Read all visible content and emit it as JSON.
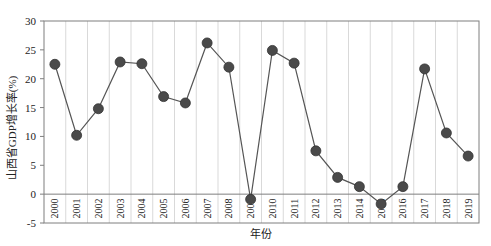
{
  "chart_data": {
    "type": "line",
    "title": "",
    "xlabel": "年份",
    "ylabel": "山西省GDP增长率(%)",
    "ylim": [
      -5,
      30
    ],
    "yticks": [
      -5,
      0,
      5,
      10,
      15,
      20,
      25,
      30
    ],
    "grid": {
      "vertical": true,
      "horizontal": false
    },
    "legend": null,
    "categories": [
      "2000",
      "2001",
      "2002",
      "2003",
      "2004",
      "2005",
      "2006",
      "2007",
      "2008",
      "2009",
      "2010",
      "2011",
      "2012",
      "2013",
      "2014",
      "2015",
      "2016",
      "2017",
      "2018",
      "2019"
    ],
    "series": [
      {
        "name": "山西省GDP增长率",
        "color": "#555555",
        "marker": "circle",
        "values": [
          22.5,
          10.2,
          14.8,
          22.9,
          22.6,
          16.9,
          15.8,
          26.2,
          22.0,
          -0.9,
          24.9,
          22.7,
          7.5,
          2.9,
          1.3,
          -1.7,
          1.3,
          21.7,
          10.6,
          6.6
        ]
      }
    ]
  },
  "colors": {
    "line": "#555555",
    "marker": "#4a4a4a",
    "grid": "#d9d9d9",
    "axis": "#7f7f7f"
  }
}
